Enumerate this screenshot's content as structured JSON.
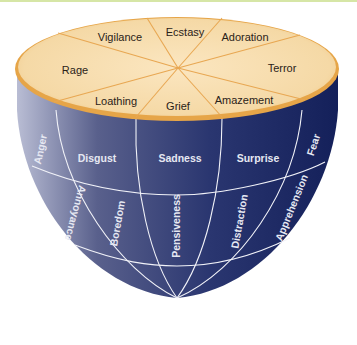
{
  "colors": {
    "top_face": "#f6dcae",
    "top_rim": "#e9a94a",
    "body_dark": "#1c2a66",
    "body_light": "#a6abc7",
    "grid_line": "#f4f4f8",
    "label_top": "#2a2218",
    "label_side": "#e6e8f2"
  },
  "top_face": {
    "labels": [
      "Vigilance",
      "Ecstasy",
      "Adoration",
      "Terror",
      "Amazement",
      "Grief",
      "Loathing",
      "Rage"
    ]
  },
  "side": {
    "ring1": [
      "Anger",
      "Disgust",
      "Sadness",
      "Surprise",
      "Fear"
    ],
    "ring2": [
      "Annoyance",
      "Boredom",
      "Pensiveness",
      "Distraction",
      "Apprehension"
    ]
  }
}
